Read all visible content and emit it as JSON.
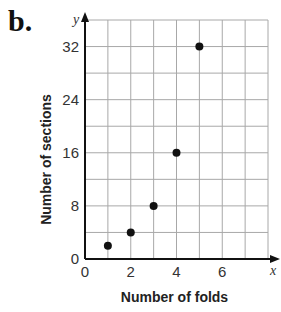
{
  "part_label": "b.",
  "chart_data": {
    "type": "scatter",
    "title": "",
    "xlabel": "Number of folds",
    "ylabel": "Number of sections",
    "x_axis_var": "x",
    "y_axis_var": "y",
    "x": [
      1,
      2,
      3,
      4,
      5
    ],
    "y": [
      2,
      4,
      8,
      16,
      32
    ],
    "series": [
      {
        "name": "sections",
        "x": [
          1,
          2,
          3,
          4,
          5
        ],
        "values": [
          2,
          4,
          8,
          16,
          32
        ]
      }
    ],
    "xticks": [
      "0",
      "2",
      "4",
      "6"
    ],
    "yticks": [
      "0",
      "8",
      "16",
      "24",
      "32"
    ],
    "xlim": [
      0,
      8
    ],
    "ylim": [
      0,
      36
    ],
    "grid": true,
    "x_grid_step": 1,
    "y_grid_step": 4,
    "legend": "none"
  }
}
